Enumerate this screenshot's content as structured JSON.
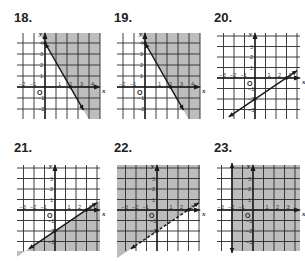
{
  "colors": {
    "shade": "#bdbdbd",
    "grid": "#2a2a2a",
    "line": "#1a1a1a",
    "text": "#222222"
  },
  "chart_data": [
    {
      "id": "18",
      "label": "18.",
      "type": "line",
      "title": "18.",
      "xlabel": "x",
      "ylabel": "y",
      "x_ticks": [
        "−2",
        "−1",
        "1",
        "2",
        "3",
        "4"
      ],
      "y_ticks": [
        "4",
        "3",
        "2",
        "1",
        "−1",
        "−2"
      ],
      "xlim": [
        -3,
        5
      ],
      "ylim": [
        -3,
        4.5
      ],
      "grid": true,
      "boundary": {
        "style": "solid",
        "points": [
          [
            0,
            4
          ],
          [
            2.3,
            0
          ],
          [
            3.5,
            -2.1
          ]
        ],
        "intercepts": {
          "y": 4,
          "x": 2.3
        }
      },
      "shading": "right of line (above)",
      "origin": "O"
    },
    {
      "id": "19",
      "label": "19.",
      "type": "line",
      "title": "19.",
      "xlabel": "x",
      "ylabel": "y",
      "x_ticks": [
        "−2",
        "−1",
        "1",
        "2",
        "3",
        "4"
      ],
      "y_ticks": [
        "4",
        "3",
        "2",
        "1",
        "−1",
        "−2"
      ],
      "xlim": [
        -3,
        5
      ],
      "ylim": [
        -3,
        4.5
      ],
      "grid": true,
      "boundary": {
        "style": "solid",
        "points": [
          [
            0,
            4
          ],
          [
            2.3,
            0
          ],
          [
            3.5,
            -2.1
          ]
        ],
        "intercepts": {
          "y": 4,
          "x": 2.3
        }
      },
      "shading": "right of line (above)",
      "origin": "O"
    },
    {
      "id": "20",
      "label": "20.",
      "type": "line",
      "title": "20.",
      "xlabel": "x",
      "ylabel": "y",
      "x_ticks": [
        "−3",
        "−2",
        "−1",
        "1",
        "2",
        "3"
      ],
      "y_ticks": [
        "3",
        "2",
        "1",
        "−1",
        "−2",
        "−3"
      ],
      "xlim": [
        -4,
        4
      ],
      "ylim": [
        -4,
        4
      ],
      "grid": true,
      "boundary": {
        "style": "solid",
        "points": [
          [
            -2.5,
            -3.7
          ],
          [
            4,
            0.7
          ]
        ],
        "intercepts": {
          "y": -2,
          "x": 3
        }
      },
      "shading": "none",
      "origin": "O"
    },
    {
      "id": "21",
      "label": "21.",
      "type": "line",
      "title": "21.",
      "xlabel": "x",
      "ylabel": "y",
      "x_ticks": [
        "−3",
        "−2",
        "−1",
        "1",
        "2",
        "3"
      ],
      "y_ticks": [
        "3",
        "2",
        "1",
        "−1",
        "−2",
        "−3"
      ],
      "xlim": [
        -4,
        4
      ],
      "ylim": [
        -4,
        4
      ],
      "grid": true,
      "boundary": {
        "style": "solid",
        "points": [
          [
            -2.5,
            -3.7
          ],
          [
            4,
            0.7
          ]
        ],
        "intercepts": {
          "y": -2,
          "x": 3
        }
      },
      "shading": "below line",
      "origin": "O"
    },
    {
      "id": "22",
      "label": "22.",
      "type": "line",
      "title": "22.",
      "xlabel": "x",
      "ylabel": "y",
      "x_ticks": [
        "−3",
        "−2",
        "−1",
        "1",
        "2",
        "3"
      ],
      "y_ticks": [
        "3",
        "2",
        "1",
        "−1",
        "−2"
      ],
      "xlim": [
        -4,
        4
      ],
      "ylim": [
        -4,
        4
      ],
      "grid": true,
      "boundary": {
        "style": "dashed",
        "points": [
          [
            -2.5,
            -3.7
          ],
          [
            4,
            0.7
          ]
        ],
        "intercepts": {
          "y": -2,
          "x": 3
        }
      },
      "shading": "above line",
      "origin": "O"
    },
    {
      "id": "23",
      "label": "23.",
      "type": "line",
      "title": "23.",
      "xlabel": "x",
      "ylabel": "y",
      "x_ticks": [
        "−3",
        "−2",
        "−1",
        "1",
        "2",
        "3"
      ],
      "y_ticks": [
        "3",
        "2",
        "1",
        "−1",
        "−2",
        "−3"
      ],
      "xlim": [
        -4,
        4
      ],
      "ylim": [
        -4,
        4
      ],
      "grid": true,
      "boundary": {
        "style": "solid",
        "vertical_x": -2
      },
      "shading": "right of line",
      "origin": "O"
    }
  ]
}
